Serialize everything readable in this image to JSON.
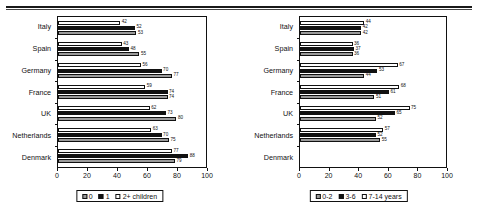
{
  "chart_data": [
    {
      "type": "bar",
      "orientation": "horizontal",
      "title": "",
      "xlabel": "",
      "ylabel": "",
      "xlim": [
        0,
        100
      ],
      "xticks": [
        0,
        20,
        40,
        60,
        80,
        100
      ],
      "grid": false,
      "legend_position": "bottom",
      "categories": [
        "Italy",
        "Spain",
        "Germany",
        "France",
        "UK",
        "Netherlands",
        "Denmark"
      ],
      "series": [
        {
          "name": "0",
          "style": "gray",
          "values": [
            53,
            55,
            77,
            74,
            80,
            75,
            79
          ]
        },
        {
          "name": "1",
          "style": "black",
          "values": [
            52,
            48,
            70,
            74,
            73,
            70,
            88
          ]
        },
        {
          "name": "2+ children",
          "style": "white",
          "values": [
            42,
            43,
            56,
            59,
            62,
            63,
            77
          ]
        }
      ],
      "legend": [
        {
          "label": "0",
          "style": "gray"
        },
        {
          "label": "1",
          "style": "black"
        },
        {
          "label": "2+ children",
          "style": "white"
        }
      ]
    },
    {
      "type": "bar",
      "orientation": "horizontal",
      "title": "",
      "xlabel": "",
      "ylabel": "",
      "xlim": [
        0,
        100
      ],
      "xticks": [
        0,
        20,
        40,
        60,
        80,
        100
      ],
      "grid": false,
      "legend_position": "bottom",
      "categories": [
        "Italy",
        "Spain",
        "Germany",
        "France",
        "UK",
        "Netherlands",
        "Denmark"
      ],
      "series": [
        {
          "name": "0-2",
          "style": "gray",
          "values": [
            42,
            36,
            44,
            51,
            52,
            55,
            null
          ]
        },
        {
          "name": "3-6",
          "style": "black",
          "values": [
            42,
            37,
            53,
            61,
            65,
            52,
            null
          ]
        },
        {
          "name": "7-14 years",
          "style": "white",
          "values": [
            44,
            36,
            67,
            68,
            75,
            57,
            null
          ]
        }
      ],
      "legend": [
        {
          "label": "0-2",
          "style": "gray"
        },
        {
          "label": "3-6",
          "style": "black"
        },
        {
          "label": "7-14 years",
          "style": "white"
        }
      ]
    }
  ]
}
